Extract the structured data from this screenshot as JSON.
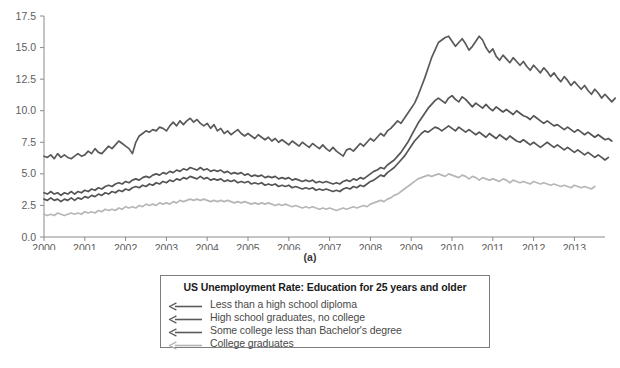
{
  "figure": {
    "panel_caption": "(a)"
  },
  "legend": {
    "title": "US Unemployment Rate: Education for 25 years and older",
    "entries": [
      {
        "label": "Less than a high school diploma",
        "color": "#5a5a5a",
        "icon": "left-arrow-line-icon"
      },
      {
        "label": "High school graduates, no college",
        "color": "#5a5a5a",
        "icon": "left-arrow-line-icon"
      },
      {
        "label": "Some college less than Bachelor's degree",
        "color": "#5a5a5a",
        "icon": "left-arrow-line-icon"
      },
      {
        "label": "College graduates",
        "color": "#b4b4b4",
        "icon": "left-arrow-line-icon"
      }
    ]
  },
  "chart_data": {
    "type": "line",
    "title": "US Unemployment Rate: Education for 25 years and older",
    "xlabel": "",
    "ylabel": "",
    "xlim": [
      2000.0,
      2013.75
    ],
    "ylim": [
      0.0,
      17.5
    ],
    "grid": false,
    "legend_position": "below-plot",
    "y_ticks": [
      0.0,
      2.5,
      5.0,
      7.5,
      10.0,
      12.5,
      15.0,
      17.5
    ],
    "y_tick_labels": [
      "0.0",
      "2.5",
      "5.0",
      "7.5",
      "10.0",
      "12.5",
      "15.0",
      "17.5"
    ],
    "x_ticks": [
      2000,
      2001,
      2002,
      2003,
      2004,
      2005,
      2006,
      2007,
      2008,
      2009,
      2010,
      2011,
      2012,
      2013
    ],
    "x_tick_labels": [
      "2000",
      "2001",
      "2002",
      "2003",
      "2004",
      "2005",
      "2006",
      "2007",
      "2008",
      "2009",
      "2010",
      "2011",
      "2012",
      "2013"
    ],
    "x_start": 2000.0,
    "x_step": 0.0833333,
    "series": [
      {
        "name": "Less than a high school diploma",
        "color": "#5a5a5a",
        "values": [
          6.4,
          6.3,
          6.5,
          6.2,
          6.6,
          6.3,
          6.5,
          6.3,
          6.2,
          6.4,
          6.6,
          6.4,
          6.5,
          6.8,
          6.6,
          7.0,
          6.7,
          6.6,
          6.9,
          7.2,
          7.0,
          7.3,
          7.6,
          7.4,
          7.2,
          7.0,
          6.6,
          7.5,
          8.0,
          8.2,
          8.4,
          8.3,
          8.5,
          8.4,
          8.7,
          8.6,
          8.4,
          8.8,
          9.1,
          8.8,
          9.2,
          8.9,
          9.2,
          9.4,
          9.1,
          9.3,
          9.0,
          8.8,
          9.0,
          8.6,
          8.9,
          8.4,
          8.6,
          8.2,
          8.4,
          8.1,
          8.3,
          8.5,
          8.2,
          8.0,
          8.2,
          8.0,
          7.8,
          8.1,
          7.9,
          7.7,
          7.9,
          7.6,
          7.8,
          7.5,
          7.7,
          7.5,
          7.3,
          7.6,
          7.4,
          7.2,
          7.5,
          7.3,
          7.1,
          7.4,
          7.2,
          7.0,
          7.3,
          7.0,
          6.8,
          7.1,
          6.8,
          6.6,
          6.4,
          6.9,
          7.0,
          6.8,
          7.1,
          7.4,
          7.2,
          7.5,
          7.8,
          7.6,
          7.9,
          8.2,
          8.0,
          8.4,
          8.6,
          8.9,
          9.2,
          9.0,
          9.4,
          9.8,
          10.2,
          10.6,
          11.2,
          11.9,
          12.6,
          13.4,
          14.2,
          14.8,
          15.4,
          15.6,
          15.8,
          15.9,
          15.5,
          15.1,
          15.4,
          15.7,
          15.3,
          14.8,
          15.1,
          15.5,
          15.9,
          15.6,
          15.0,
          14.6,
          14.9,
          14.3,
          14.0,
          14.4,
          14.1,
          13.8,
          14.2,
          13.9,
          13.6,
          13.9,
          13.5,
          13.2,
          13.6,
          13.3,
          13.0,
          13.4,
          13.1,
          12.7,
          13.0,
          12.6,
          12.3,
          12.7,
          12.4,
          12.0,
          12.3,
          12.0,
          11.7,
          12.0,
          11.6,
          11.3,
          11.7,
          11.4,
          11.0,
          11.3,
          11.0,
          10.7,
          11.0
        ],
        "last_value": 11.0
      },
      {
        "name": "High school graduates, no college",
        "color": "#555555",
        "values": [
          3.5,
          3.4,
          3.6,
          3.4,
          3.5,
          3.3,
          3.5,
          3.4,
          3.6,
          3.4,
          3.6,
          3.5,
          3.7,
          3.6,
          3.8,
          3.7,
          3.9,
          3.8,
          4.0,
          4.1,
          4.0,
          4.2,
          4.3,
          4.2,
          4.4,
          4.3,
          4.5,
          4.6,
          4.5,
          4.7,
          4.8,
          4.7,
          4.9,
          5.0,
          4.9,
          5.1,
          5.0,
          5.2,
          5.1,
          5.3,
          5.2,
          5.4,
          5.3,
          5.5,
          5.4,
          5.3,
          5.5,
          5.3,
          5.4,
          5.2,
          5.3,
          5.2,
          5.3,
          5.1,
          5.2,
          5.0,
          5.1,
          5.0,
          5.1,
          4.9,
          5.0,
          4.8,
          4.9,
          4.8,
          4.9,
          4.7,
          4.8,
          4.7,
          4.8,
          4.6,
          4.7,
          4.6,
          4.7,
          4.5,
          4.6,
          4.5,
          4.4,
          4.5,
          4.4,
          4.5,
          4.3,
          4.4,
          4.3,
          4.4,
          4.3,
          4.2,
          4.3,
          4.2,
          4.4,
          4.5,
          4.4,
          4.6,
          4.5,
          4.7,
          4.6,
          4.8,
          5.0,
          5.2,
          5.3,
          5.5,
          5.4,
          5.7,
          5.9,
          6.1,
          6.4,
          6.7,
          7.1,
          7.5,
          8.0,
          8.5,
          9.0,
          9.4,
          9.8,
          10.2,
          10.5,
          10.8,
          11.0,
          10.8,
          10.6,
          11.0,
          11.2,
          10.9,
          10.7,
          11.1,
          10.9,
          10.6,
          10.3,
          10.6,
          10.4,
          10.2,
          10.5,
          10.2,
          10.0,
          10.3,
          10.1,
          9.9,
          10.1,
          9.9,
          9.7,
          10.0,
          9.8,
          9.6,
          9.5,
          9.3,
          9.6,
          9.4,
          9.2,
          9.0,
          9.2,
          9.0,
          8.8,
          8.9,
          8.7,
          8.5,
          8.7,
          8.5,
          8.3,
          8.5,
          8.3,
          8.1,
          8.3,
          8.1,
          7.9,
          8.1,
          7.9,
          7.7,
          7.8,
          7.6
        ],
        "last_value": 7.6
      },
      {
        "name": "Some college less than Bachelor's degree",
        "color": "#545454",
        "values": [
          3.0,
          2.9,
          3.1,
          2.9,
          3.0,
          2.8,
          3.0,
          2.9,
          3.1,
          2.9,
          3.1,
          3.0,
          3.2,
          3.1,
          3.3,
          3.2,
          3.4,
          3.3,
          3.5,
          3.4,
          3.6,
          3.5,
          3.7,
          3.6,
          3.8,
          3.7,
          3.9,
          4.0,
          3.9,
          4.1,
          4.0,
          4.2,
          4.1,
          4.3,
          4.2,
          4.4,
          4.3,
          4.5,
          4.4,
          4.6,
          4.5,
          4.7,
          4.6,
          4.8,
          4.7,
          4.6,
          4.8,
          4.6,
          4.7,
          4.5,
          4.6,
          4.5,
          4.6,
          4.4,
          4.5,
          4.4,
          4.5,
          4.3,
          4.4,
          4.3,
          4.4,
          4.2,
          4.3,
          4.2,
          4.3,
          4.1,
          4.2,
          4.1,
          4.2,
          4.0,
          4.1,
          4.0,
          4.1,
          3.9,
          4.0,
          3.9,
          3.8,
          3.9,
          3.8,
          3.9,
          3.7,
          3.8,
          3.7,
          3.8,
          3.7,
          3.6,
          3.7,
          3.6,
          3.8,
          3.9,
          3.8,
          4.0,
          3.9,
          4.1,
          4.0,
          4.2,
          4.4,
          4.5,
          4.7,
          4.9,
          4.8,
          5.1,
          5.3,
          5.5,
          5.8,
          6.1,
          6.4,
          6.8,
          7.2,
          7.6,
          7.9,
          8.2,
          8.4,
          8.3,
          8.5,
          8.7,
          8.6,
          8.4,
          8.6,
          8.8,
          8.6,
          8.4,
          8.7,
          8.5,
          8.3,
          8.5,
          8.3,
          8.1,
          8.3,
          8.1,
          7.9,
          8.2,
          8.0,
          7.8,
          8.1,
          7.9,
          7.7,
          8.0,
          7.8,
          7.6,
          7.5,
          7.7,
          7.5,
          7.3,
          7.5,
          7.3,
          7.1,
          7.3,
          7.5,
          7.3,
          7.1,
          7.3,
          7.1,
          6.9,
          7.1,
          6.9,
          6.7,
          6.9,
          6.7,
          6.5,
          6.7,
          6.5,
          6.3,
          6.5,
          6.3,
          6.1,
          6.3
        ],
        "last_value": 6.3
      },
      {
        "name": "College graduates",
        "color": "#b7b7b7",
        "values": [
          1.8,
          1.7,
          1.8,
          1.7,
          1.9,
          1.8,
          1.7,
          1.8,
          1.9,
          1.8,
          1.9,
          1.8,
          2.0,
          1.9,
          2.0,
          1.9,
          2.1,
          2.0,
          2.2,
          2.1,
          2.2,
          2.1,
          2.3,
          2.2,
          2.4,
          2.3,
          2.4,
          2.3,
          2.5,
          2.4,
          2.6,
          2.5,
          2.6,
          2.5,
          2.7,
          2.6,
          2.7,
          2.6,
          2.8,
          2.7,
          2.9,
          2.8,
          2.9,
          3.0,
          2.9,
          3.0,
          2.9,
          3.0,
          2.9,
          2.8,
          2.9,
          2.8,
          2.9,
          2.8,
          2.9,
          2.8,
          2.7,
          2.8,
          2.7,
          2.8,
          2.7,
          2.6,
          2.7,
          2.6,
          2.7,
          2.6,
          2.7,
          2.6,
          2.5,
          2.6,
          2.5,
          2.6,
          2.5,
          2.4,
          2.5,
          2.4,
          2.3,
          2.4,
          2.3,
          2.4,
          2.3,
          2.2,
          2.3,
          2.2,
          2.3,
          2.2,
          2.1,
          2.2,
          2.3,
          2.2,
          2.3,
          2.4,
          2.3,
          2.4,
          2.5,
          2.4,
          2.6,
          2.7,
          2.8,
          2.9,
          2.8,
          3.0,
          3.1,
          3.3,
          3.4,
          3.6,
          3.8,
          4.0,
          4.2,
          4.4,
          4.6,
          4.7,
          4.8,
          4.9,
          4.8,
          4.9,
          5.0,
          4.9,
          4.8,
          5.0,
          4.9,
          4.8,
          4.7,
          4.9,
          4.8,
          4.6,
          4.8,
          4.7,
          4.5,
          4.7,
          4.6,
          4.5,
          4.6,
          4.5,
          4.4,
          4.6,
          4.5,
          4.3,
          4.5,
          4.4,
          4.3,
          4.4,
          4.3,
          4.2,
          4.4,
          4.3,
          4.2,
          4.3,
          4.2,
          4.1,
          4.2,
          4.1,
          4.0,
          4.1,
          4.0,
          3.9,
          4.1,
          4.0,
          3.9,
          4.0,
          3.9,
          3.8,
          4.0
        ],
        "last_value": 4.0
      }
    ]
  }
}
